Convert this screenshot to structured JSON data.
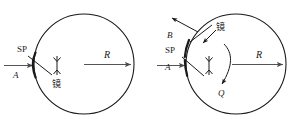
{
  "figure": {
    "background_color": "#ffffff",
    "ink_color": "#1a1a1a",
    "ray_color": "#555555",
    "width": 300,
    "height": 130,
    "panels": [
      {
        "id": "left",
        "name": "panel-left",
        "circle": {
          "cx": 84,
          "cy": 64,
          "r": 50
        },
        "labels": {
          "incident_ray": "A",
          "mirror_point": "SP",
          "mirror_cjk": "镜",
          "radius": "R"
        }
      },
      {
        "id": "right",
        "name": "panel-right",
        "circle": {
          "cx": 236,
          "cy": 64,
          "r": 50
        },
        "labels": {
          "incident_ray": "A",
          "reflected_ray": "B",
          "mirror_point": "SP",
          "mirror_cjk": "镜",
          "radius": "R",
          "rotation": "Q"
        }
      }
    ]
  }
}
